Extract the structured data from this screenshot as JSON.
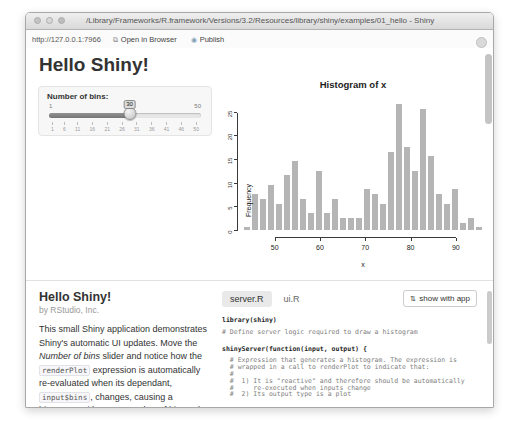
{
  "window": {
    "title": "/Library/Frameworks/R.framework/Versions/3.2/Resources/library/shiny/examples/01_hello - Shiny",
    "traffic_lights": [
      "#c3c3c3",
      "#d8d8d8",
      "#bcbcbc"
    ],
    "toolbar": {
      "url": "http://127.0.0.1:7966",
      "open_in_browser_icon": "⧉",
      "open_in_browser": "Open in Browser",
      "publish_icon": "◉",
      "publish": "Publish"
    }
  },
  "app": {
    "heading": "Hello Shiny!",
    "slider": {
      "label": "Number of bins:",
      "min": 1,
      "max": 50,
      "value": 30,
      "min_label": "1",
      "max_label": "50",
      "tooltip": "30",
      "handle_pos_pct": 53,
      "scale_ticks": [
        "1",
        "6",
        "11",
        "16",
        "21",
        "26",
        "31",
        "36",
        "41",
        "46",
        "50"
      ]
    }
  },
  "chart_data": {
    "type": "bar",
    "title": "Histogram of x",
    "xlabel": "x",
    "ylabel": "Frequency",
    "bins": {
      "start": 43,
      "end": 96,
      "count": 30,
      "width": 1.7667
    },
    "values": [
      1,
      8,
      7,
      10,
      6,
      12,
      15,
      7,
      4,
      13,
      4,
      7,
      3,
      3,
      3,
      9,
      8,
      6,
      17,
      27,
      18,
      13,
      26,
      16,
      8,
      6,
      9,
      2,
      3,
      1
    ],
    "x_ticks": [
      50,
      60,
      70,
      80,
      90
    ],
    "y_ticks": [
      0,
      5,
      10,
      15,
      20,
      25
    ],
    "ylim": [
      0,
      27.5
    ],
    "grid": false,
    "bar_color": "#b5b5b5",
    "bar_border": "#ffffff"
  },
  "docs": {
    "title": "Hello Shiny!",
    "byline": "by RStudio, Inc.",
    "description": [
      {
        "s": "p",
        "x": "This small Shiny application demonstrates Shiny's automatic UI updates. Move the "
      },
      {
        "s": "em",
        "x": "Number of bins"
      },
      {
        "s": "p",
        "x": " slider and notice how the "
      },
      {
        "s": "code",
        "x": "renderPlot"
      },
      {
        "s": "p",
        "x": " expression is automatically re-evaluated when its dependant, "
      },
      {
        "s": "code",
        "x": "input$bins"
      },
      {
        "s": "p",
        "x": ", changes, causing a histogram with a new number of bins to be rendered."
      }
    ]
  },
  "code_panel": {
    "tabs": [
      {
        "label": "server.R",
        "active": true
      },
      {
        "label": "ui.R",
        "active": false
      }
    ],
    "show_with_app": {
      "icon": "⇅",
      "label": "show with app"
    },
    "lines": [
      {
        "t": "code",
        "x": "library(shiny)"
      },
      {
        "t": "blank",
        "x": ""
      },
      {
        "t": "comment",
        "x": "# Define server logic required to draw a histogram"
      },
      {
        "t": "code",
        "x": "shinyServer(function(input, output) {"
      },
      {
        "t": "blank",
        "x": ""
      },
      {
        "t": "comment",
        "x": "  # Expression that generates a histogram. The expression is"
      },
      {
        "t": "comment",
        "x": "  # wrapped in a call to renderPlot to indicate that:"
      },
      {
        "t": "comment",
        "x": "  #"
      },
      {
        "t": "comment",
        "x": "  #  1) It is \"reactive\" and therefore should be automatically"
      },
      {
        "t": "comment",
        "x": "  #     re-executed when inputs change"
      },
      {
        "t": "comment",
        "x": "  #  2) Its output type is a plot"
      },
      {
        "t": "blank",
        "x": ""
      },
      {
        "t": "code",
        "x": "  output$distPlot <- renderPlot({"
      },
      {
        "t": "code",
        "x": "    x    <- faithful[, 2]  # Old Faithful Geyser data"
      },
      {
        "t": "code",
        "x": "    bins <- seq(min(x), max(x), length.out = input$bins + 1)"
      }
    ]
  }
}
